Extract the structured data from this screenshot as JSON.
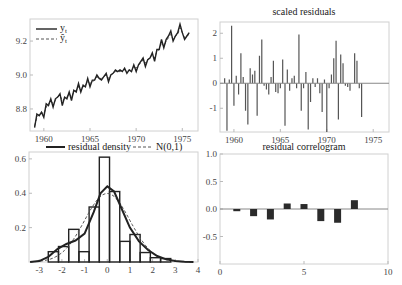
{
  "chart_data": [
    {
      "id": "fitted",
      "type": "line",
      "title": "",
      "xlabel": "",
      "ylabel": "",
      "legend": [
        "y_t",
        "ŷ_t"
      ],
      "xlim": [
        1958.5,
        1976.7
      ],
      "ylim": [
        8.67,
        9.33
      ],
      "xticks": [
        1960,
        1965,
        1970,
        1975
      ],
      "yticks": [
        8.8,
        9.0,
        9.2
      ],
      "x": [
        1959.0,
        1959.25,
        1959.5,
        1959.75,
        1960.0,
        1960.25,
        1960.5,
        1960.75,
        1961.0,
        1961.25,
        1961.5,
        1961.75,
        1962.0,
        1962.25,
        1962.5,
        1962.75,
        1963.0,
        1963.25,
        1963.5,
        1963.75,
        1964.0,
        1964.25,
        1964.5,
        1964.75,
        1965.0,
        1965.25,
        1965.5,
        1965.75,
        1966.0,
        1966.25,
        1966.5,
        1966.75,
        1967.0,
        1967.25,
        1967.5,
        1967.75,
        1968.0,
        1968.25,
        1968.5,
        1968.75,
        1969.0,
        1969.25,
        1969.5,
        1969.75,
        1970.0,
        1970.25,
        1970.5,
        1970.75,
        1971.0,
        1971.25,
        1971.5,
        1971.75,
        1972.0,
        1972.25,
        1972.5,
        1972.75,
        1973.0,
        1973.25,
        1973.5,
        1973.75,
        1974.0,
        1974.25,
        1974.5,
        1974.75,
        1975.0,
        1975.25,
        1975.5,
        1975.75
      ],
      "series": [
        {
          "name": "y_t",
          "style": "solid",
          "values": [
            8.69,
            8.77,
            8.76,
            8.78,
            8.75,
            8.83,
            8.82,
            8.86,
            8.81,
            8.86,
            8.87,
            8.89,
            8.82,
            8.87,
            8.86,
            8.9,
            8.85,
            8.91,
            8.9,
            8.95,
            8.9,
            8.94,
            8.93,
            8.98,
            8.93,
            8.97,
            8.97,
            9.0,
            8.98,
            8.97,
            8.99,
            9.01,
            8.96,
            9.0,
            9.01,
            9.03,
            9.02,
            9.03,
            9.02,
            9.04,
            9.01,
            9.03,
            9.02,
            9.06,
            9.02,
            9.06,
            9.08,
            9.1,
            9.05,
            9.09,
            9.1,
            9.13,
            9.08,
            9.15,
            9.15,
            9.21,
            9.16,
            9.21,
            9.23,
            9.26,
            9.2,
            9.23,
            9.25,
            9.3,
            9.25,
            9.21,
            9.23,
            9.25
          ]
        },
        {
          "name": "ŷ_t",
          "style": "dashed",
          "values": [
            8.7,
            8.75,
            8.77,
            8.78,
            8.77,
            8.81,
            8.83,
            8.85,
            8.83,
            8.85,
            8.87,
            8.88,
            8.85,
            8.86,
            8.87,
            8.89,
            8.87,
            8.9,
            8.91,
            8.93,
            8.92,
            8.93,
            8.94,
            8.96,
            8.95,
            8.96,
            8.97,
            8.99,
            8.98,
            8.98,
            8.99,
            9.0,
            8.98,
            9.0,
            9.01,
            9.02,
            9.02,
            9.02,
            9.03,
            9.03,
            9.02,
            9.03,
            9.03,
            9.05,
            9.04,
            9.06,
            9.07,
            9.09,
            9.07,
            9.09,
            9.1,
            9.12,
            9.1,
            9.14,
            9.15,
            9.19,
            9.17,
            9.2,
            9.22,
            9.24,
            9.21,
            9.23,
            9.24,
            9.28,
            9.25,
            9.22,
            9.23,
            9.24
          ]
        }
      ]
    },
    {
      "id": "residuals",
      "type": "bar",
      "title": "scaled residuals",
      "xlim": [
        1958.5,
        1976.7
      ],
      "ylim": [
        -1.95,
        2.45
      ],
      "xticks": [
        1960,
        1965,
        1970,
        1975
      ],
      "yticks": [
        -1,
        0,
        1,
        2
      ],
      "x": [
        1959.0,
        1959.25,
        1959.5,
        1959.75,
        1960.0,
        1960.25,
        1960.5,
        1960.75,
        1961.0,
        1961.25,
        1961.5,
        1961.75,
        1962.0,
        1962.25,
        1962.5,
        1962.75,
        1963.0,
        1963.25,
        1963.5,
        1963.75,
        1964.0,
        1964.25,
        1964.5,
        1964.75,
        1965.0,
        1965.25,
        1965.5,
        1965.75,
        1966.0,
        1966.25,
        1966.5,
        1966.75,
        1967.0,
        1967.25,
        1967.5,
        1967.75,
        1968.0,
        1968.25,
        1968.5,
        1968.75,
        1969.0,
        1969.25,
        1969.5,
        1969.75,
        1970.0,
        1970.25,
        1970.5,
        1970.75,
        1971.0,
        1971.25,
        1971.5,
        1971.75,
        1972.0,
        1972.25,
        1972.5,
        1972.75,
        1973.0,
        1973.25,
        1973.5,
        1973.75,
        1974.0,
        1974.25,
        1974.5,
        1974.75,
        1975.0,
        1975.25,
        1975.5,
        1975.75
      ],
      "values": [
        0.2,
        -1.9,
        0.15,
        2.3,
        -0.9,
        0.3,
        -0.45,
        1.2,
        0.25,
        -1.1,
        -1.65,
        0.6,
        0.35,
        0.5,
        -1.3,
        1.1,
        1.75,
        -0.1,
        -0.25,
        -0.45,
        0.25,
        0.9,
        -0.35,
        -0.4,
        -0.2,
        0.95,
        -1.7,
        0.55,
        -0.3,
        0.2,
        0.3,
        -0.2,
        1.95,
        -1.1,
        -0.2,
        0.45,
        -1.85,
        -0.75,
        0.2,
        -0.15,
        0.2,
        -0.4,
        -1.15,
        0.15,
        -1.95,
        -0.2,
        0.35,
        1.0,
        1.7,
        -1.45,
        1.15,
        0.8,
        -0.1,
        -0.15,
        -0.3,
        0.0,
        1.2,
        0.9,
        -0.2,
        -1.35,
        0.0,
        0.0,
        0.0,
        0.0,
        0.0,
        0.0,
        0.0,
        0.0
      ]
    },
    {
      "id": "density",
      "type": "bar",
      "title": "",
      "legend": [
        "residual density",
        "N(0,1)"
      ],
      "xlim": [
        -3.45,
        4.0
      ],
      "ylim": [
        0.0,
        0.64
      ],
      "xticks": [
        -3,
        -2,
        -1,
        0,
        1,
        2,
        3,
        4
      ],
      "yticks": [
        0.2,
        0.4,
        0.6
      ],
      "bin_edges": [
        -2.6,
        -2.15,
        -1.7,
        -1.25,
        -0.8,
        -0.35,
        0.1,
        0.55,
        1.0,
        1.45,
        1.9,
        2.35,
        2.8
      ],
      "values": [
        0.06,
        0.09,
        0.19,
        0.06,
        0.32,
        0.61,
        0.41,
        0.12,
        0.16,
        0.055,
        0.025,
        0.02
      ],
      "kde": {
        "x": [
          -3.4,
          -3.0,
          -2.6,
          -2.2,
          -1.8,
          -1.4,
          -1.0,
          -0.6,
          -0.3,
          0.0,
          0.3,
          0.6,
          1.0,
          1.4,
          1.8,
          2.2,
          2.6,
          3.0,
          3.4,
          3.8
        ],
        "y": [
          0.0,
          0.005,
          0.03,
          0.075,
          0.105,
          0.125,
          0.165,
          0.29,
          0.4,
          0.44,
          0.41,
          0.32,
          0.2,
          0.12,
          0.07,
          0.035,
          0.015,
          0.006,
          0.002,
          0.0
        ]
      },
      "normal": {
        "mean": 0,
        "sd": 1
      }
    },
    {
      "id": "correlogram",
      "type": "bar",
      "title": "residual correlogram",
      "xlim": [
        0,
        10
      ],
      "ylim": [
        -1.0,
        1.0
      ],
      "xticks": [
        0,
        5,
        10
      ],
      "yticks": [
        -0.5,
        0.0,
        0.5,
        1.0
      ],
      "categories": [
        1,
        2,
        3,
        4,
        5,
        6,
        7,
        8
      ],
      "values": [
        -0.04,
        -0.13,
        -0.19,
        0.1,
        0.09,
        -0.22,
        -0.25,
        0.16
      ]
    }
  ],
  "labels": {
    "fitted_legend_y": "y",
    "fitted_legend_y_sub": "t",
    "fitted_legend_yhat": "ŷ",
    "fitted_legend_yhat_sub": "t",
    "residuals_title": "scaled residuals",
    "density_legend_kde": "residual density",
    "density_legend_normal": "N(0,1)",
    "correlogram_title": "residual correlogram"
  },
  "colors": {
    "line": "#222222",
    "bar_fill": "#2b2b2b",
    "bar_line": "#555555",
    "frame": "#d0d0d0",
    "zero": "#888888"
  }
}
